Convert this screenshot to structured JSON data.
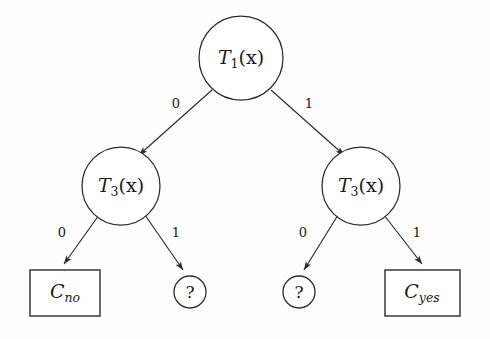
{
  "diagram": {
    "background_color": "#fdfdfd",
    "stroke_color": "#2b2b2b",
    "nodes": {
      "root": {
        "symbol": "T",
        "subscript": "1",
        "argument": "(x)",
        "full_label": "T_1(x)"
      },
      "left_internal": {
        "symbol": "T",
        "subscript": "3",
        "argument": "(x)",
        "full_label": "T_3(x)"
      },
      "right_internal": {
        "symbol": "T",
        "subscript": "3",
        "argument": "(x)",
        "full_label": "T_3(x)"
      },
      "leaf_no": {
        "symbol": "C",
        "subscript": "no",
        "full_label": "C_no"
      },
      "leaf_yes": {
        "symbol": "C",
        "subscript": "yes",
        "full_label": "C_yes"
      },
      "unknown_left": {
        "symbol": "?"
      },
      "unknown_right": {
        "symbol": "?"
      }
    },
    "edges": {
      "root_left": "0",
      "root_right": "1",
      "left_internal_left": "0",
      "left_internal_right": "1",
      "right_internal_left": "0",
      "right_internal_right": "1"
    }
  }
}
